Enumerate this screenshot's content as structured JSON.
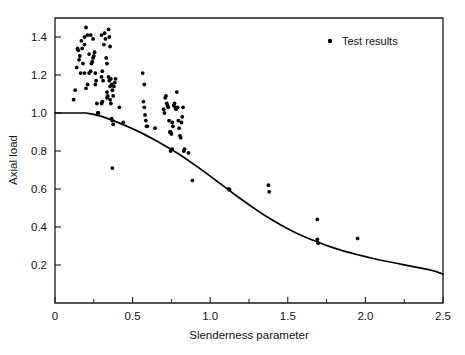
{
  "chart_data": {
    "type": "scatter",
    "title": "",
    "xlabel": "Slenderness parameter",
    "ylabel": "Axial load",
    "xlim": [
      0,
      2.5
    ],
    "ylim": [
      0,
      1.5
    ],
    "grid": false,
    "xticks": [
      0,
      0.5,
      1.0,
      1.5,
      2.0,
      2.5
    ],
    "xticklabels": [
      "0",
      "0.5",
      "1.0",
      "1.5",
      "2.0",
      "2.5"
    ],
    "xminorticks": [
      0.25,
      0.75,
      1.25,
      1.75,
      2.25
    ],
    "yticks": [
      0.2,
      0.4,
      0.6,
      0.8,
      1.0,
      1.2,
      1.4
    ],
    "yticklabels": [
      "0.2",
      "0.4",
      "0.6",
      "0.8",
      "1.0",
      "1.2",
      "1.4"
    ],
    "legend": {
      "position": "top-right",
      "entries": [
        {
          "label": "Test results",
          "marker": "dot",
          "color": "#000000"
        }
      ]
    },
    "series": [
      {
        "name": "Test results",
        "type": "scatter",
        "marker": "dot",
        "color": "#000000",
        "points": [
          [
            0.12,
            1.07
          ],
          [
            0.13,
            1.12
          ],
          [
            0.14,
            1.24
          ],
          [
            0.15,
            1.33
          ],
          [
            0.16,
            1.3
          ],
          [
            0.17,
            1.38
          ],
          [
            0.18,
            1.26
          ],
          [
            0.19,
            1.36
          ],
          [
            0.2,
            1.45
          ],
          [
            0.21,
            1.41
          ],
          [
            0.22,
            1.31
          ],
          [
            0.22,
            1.21
          ],
          [
            0.23,
            1.22
          ],
          [
            0.21,
            1.15
          ],
          [
            0.2,
            1.13
          ],
          [
            0.19,
            1.4
          ],
          [
            0.235,
            1.26
          ],
          [
            0.24,
            1.27
          ],
          [
            0.245,
            1.29
          ],
          [
            0.25,
            1.3
          ],
          [
            0.255,
            1.32
          ],
          [
            0.23,
            1.41
          ],
          [
            0.245,
            1.39
          ],
          [
            0.26,
            1.21
          ],
          [
            0.26,
            1.15
          ],
          [
            0.265,
            1.17
          ],
          [
            0.27,
            1.05
          ],
          [
            0.275,
            1.0
          ],
          [
            0.28,
            1.0
          ],
          [
            0.19,
            1.21
          ],
          [
            0.165,
            1.21
          ],
          [
            0.155,
            1.28
          ],
          [
            0.145,
            1.34
          ],
          [
            0.175,
            1.34
          ],
          [
            0.3,
            1.19
          ],
          [
            0.305,
            1.22
          ],
          [
            0.31,
            1.17
          ],
          [
            0.315,
            1.36
          ],
          [
            0.32,
            1.42
          ],
          [
            0.325,
            1.39
          ],
          [
            0.33,
            1.29
          ],
          [
            0.335,
            1.26
          ],
          [
            0.3,
            1.05
          ],
          [
            0.305,
            1.06
          ],
          [
            0.345,
            1.44
          ],
          [
            0.35,
            1.4
          ],
          [
            0.355,
            1.35
          ],
          [
            0.345,
            1.19
          ],
          [
            0.35,
            1.17
          ],
          [
            0.355,
            1.14
          ],
          [
            0.36,
            1.18
          ],
          [
            0.365,
            1.15
          ],
          [
            0.37,
            1.12
          ],
          [
            0.375,
            1.09
          ],
          [
            0.38,
            1.14
          ],
          [
            0.385,
            1.16
          ],
          [
            0.39,
            1.18
          ],
          [
            0.355,
            1.07
          ],
          [
            0.36,
            1.05
          ],
          [
            0.365,
            0.97
          ],
          [
            0.37,
            0.96
          ],
          [
            0.375,
            0.94
          ],
          [
            0.335,
            1.11
          ],
          [
            0.34,
            1.09
          ],
          [
            0.3,
            1.41
          ],
          [
            0.335,
            1.08
          ],
          [
            0.415,
            1.03
          ],
          [
            0.44,
            0.95
          ],
          [
            0.565,
            1.21
          ],
          [
            0.575,
            1.15
          ],
          [
            0.57,
            1.06
          ],
          [
            0.575,
            1.03
          ],
          [
            0.58,
            0.99
          ],
          [
            0.585,
            0.96
          ],
          [
            0.59,
            0.93
          ],
          [
            0.595,
            0.93
          ],
          [
            0.645,
            0.92
          ],
          [
            0.7,
            1.02
          ],
          [
            0.705,
            1.0
          ],
          [
            0.71,
            1.08
          ],
          [
            0.715,
            1.09
          ],
          [
            0.72,
            1.05
          ],
          [
            0.725,
            1.04
          ],
          [
            0.73,
            1.03
          ],
          [
            0.735,
            0.96
          ],
          [
            0.74,
            0.9
          ],
          [
            0.745,
            0.9
          ],
          [
            0.75,
            0.89
          ],
          [
            0.755,
            0.95
          ],
          [
            0.76,
            0.93
          ],
          [
            0.765,
            1.04
          ],
          [
            0.77,
            1.05
          ],
          [
            0.775,
            1.03
          ],
          [
            0.78,
            1.02
          ],
          [
            0.785,
            1.11
          ],
          [
            0.79,
            1.03
          ],
          [
            0.795,
            0.96
          ],
          [
            0.8,
            0.92
          ],
          [
            0.805,
            0.88
          ],
          [
            0.81,
            0.87
          ],
          [
            0.815,
            0.95
          ],
          [
            0.82,
            0.98
          ],
          [
            0.825,
            1.03
          ],
          [
            0.83,
            0.8
          ],
          [
            0.835,
            0.81
          ],
          [
            0.745,
            0.8
          ],
          [
            0.755,
            0.81
          ],
          [
            0.86,
            0.79
          ],
          [
            0.37,
            0.71
          ],
          [
            0.885,
            0.645
          ],
          [
            1.12,
            0.6
          ],
          [
            1.125,
            0.595
          ],
          [
            1.375,
            0.62
          ],
          [
            1.38,
            0.585
          ],
          [
            1.69,
            0.44
          ],
          [
            1.69,
            0.335
          ],
          [
            1.695,
            0.315
          ],
          [
            1.95,
            0.34
          ]
        ]
      },
      {
        "name": "Design curve",
        "type": "line",
        "color": "#000000",
        "points": [
          [
            0.0,
            1.0
          ],
          [
            0.05,
            1.0
          ],
          [
            0.1,
            1.0
          ],
          [
            0.15,
            1.0
          ],
          [
            0.2,
            1.0
          ],
          [
            0.25,
            0.993
          ],
          [
            0.3,
            0.982
          ],
          [
            0.35,
            0.968
          ],
          [
            0.4,
            0.952
          ],
          [
            0.45,
            0.935
          ],
          [
            0.5,
            0.917
          ],
          [
            0.55,
            0.898
          ],
          [
            0.6,
            0.877
          ],
          [
            0.65,
            0.855
          ],
          [
            0.7,
            0.832
          ],
          [
            0.75,
            0.808
          ],
          [
            0.8,
            0.783
          ],
          [
            0.85,
            0.755
          ],
          [
            0.9,
            0.727
          ],
          [
            0.95,
            0.698
          ],
          [
            1.0,
            0.668
          ],
          [
            1.05,
            0.637
          ],
          [
            1.1,
            0.607
          ],
          [
            1.15,
            0.576
          ],
          [
            1.2,
            0.546
          ],
          [
            1.25,
            0.517
          ],
          [
            1.3,
            0.489
          ],
          [
            1.35,
            0.462
          ],
          [
            1.4,
            0.437
          ],
          [
            1.45,
            0.413
          ],
          [
            1.5,
            0.391
          ],
          [
            1.55,
            0.37
          ],
          [
            1.6,
            0.351
          ],
          [
            1.65,
            0.334
          ],
          [
            1.7,
            0.318
          ],
          [
            1.75,
            0.303
          ],
          [
            1.8,
            0.289
          ],
          [
            1.85,
            0.276
          ],
          [
            1.9,
            0.265
          ],
          [
            1.95,
            0.254
          ],
          [
            2.0,
            0.244
          ],
          [
            2.05,
            0.234
          ],
          [
            2.1,
            0.225
          ],
          [
            2.15,
            0.217
          ],
          [
            2.2,
            0.209
          ],
          [
            2.25,
            0.201
          ],
          [
            2.3,
            0.193
          ],
          [
            2.35,
            0.185
          ],
          [
            2.4,
            0.177
          ],
          [
            2.45,
            0.167
          ],
          [
            2.5,
            0.152
          ]
        ]
      }
    ]
  },
  "plot_geometry": {
    "left": 55,
    "right": 443,
    "top": 18,
    "bottom": 303
  },
  "legend_label": "Test results"
}
